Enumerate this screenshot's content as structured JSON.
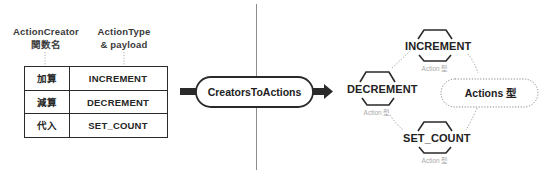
{
  "left_panel": {
    "header_creator": {
      "line1": "ActionCreator",
      "line2": "関数名"
    },
    "header_type": {
      "line1": "ActionType",
      "line2": "& payload"
    },
    "table": {
      "columns": [
        "ActionCreator 関数名",
        "ActionType & payload"
      ],
      "rows": [
        {
          "name": "加算",
          "type": "INCREMENT"
        },
        {
          "name": "減算",
          "type": "DECREMENT"
        },
        {
          "name": "代入",
          "type": "SET_COUNT"
        }
      ]
    }
  },
  "center": {
    "transform_label": "CreatorsToActions"
  },
  "right_panel": {
    "nodes": [
      {
        "label": "INCREMENT",
        "sub": "Action 型"
      },
      {
        "label": "DECREMENT",
        "sub": "Action 型"
      },
      {
        "label": "SET_COUNT",
        "sub": "Action 型"
      }
    ],
    "union_label": "Actions 型"
  },
  "colors": {
    "stroke": "#2a2a2a",
    "text": "#222222",
    "muted": "#a8a8a8",
    "dotted": "#8a8a8a",
    "background": "#ffffff"
  }
}
